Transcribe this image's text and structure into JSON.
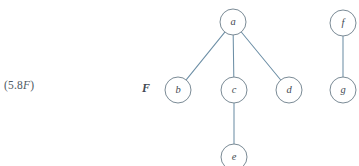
{
  "figure": {
    "equation_label_prefix": "(5.8",
    "equation_label_italic": "F",
    "equation_label_suffix": ")",
    "forest_label": "F",
    "background_color": "#ffffff",
    "edge_color": "#6d8fa6",
    "node_stroke_color": "#7b8b96",
    "node_fill_color": "#ffffff",
    "label_color": "#3f4a52"
  },
  "chart_data": {
    "type": "diagram",
    "diagram_kind": "forest-of-rooted-trees",
    "title": "",
    "nodes": [
      {
        "id": "a",
        "label": "a",
        "cx": 233,
        "cy": 22,
        "r": 13
      },
      {
        "id": "b",
        "label": "b",
        "cx": 178,
        "cy": 90,
        "r": 13
      },
      {
        "id": "c",
        "label": "c",
        "cx": 234,
        "cy": 90,
        "r": 13
      },
      {
        "id": "d",
        "label": "d",
        "cx": 289,
        "cy": 90,
        "r": 13
      },
      {
        "id": "e",
        "label": "e",
        "cx": 234,
        "cy": 157,
        "r": 13
      },
      {
        "id": "f",
        "label": "f",
        "cx": 343,
        "cy": 23,
        "r": 13
      },
      {
        "id": "g",
        "label": "g",
        "cx": 343,
        "cy": 90,
        "r": 13
      }
    ],
    "edges": [
      {
        "from": "a",
        "to": "b"
      },
      {
        "from": "a",
        "to": "c"
      },
      {
        "from": "a",
        "to": "d"
      },
      {
        "from": "c",
        "to": "e"
      },
      {
        "from": "f",
        "to": "g"
      }
    ],
    "components": [
      {
        "root": "a",
        "members": [
          "a",
          "b",
          "c",
          "d",
          "e"
        ]
      },
      {
        "root": "f",
        "members": [
          "f",
          "g"
        ]
      }
    ]
  }
}
